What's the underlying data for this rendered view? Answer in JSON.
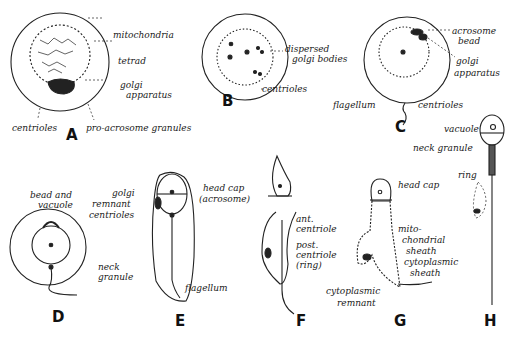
{
  "panels": [
    {
      "id": "A",
      "labels": [
        "mitochondria",
        "tetrad",
        "golgi",
        "apparatus",
        "centrioles",
        "pro-acrosome granules"
      ]
    },
    {
      "id": "B",
      "labels": [
        "dispersed",
        "golgi bodies",
        "centrioles"
      ]
    },
    {
      "id": "C",
      "labels": [
        "acrosome",
        "bead",
        "golgi",
        "apparatus",
        "flagellum",
        "centrioles"
      ]
    },
    {
      "id": "D",
      "labels": [
        "bead and",
        "vacuole",
        "neck",
        "granule"
      ]
    },
    {
      "id": "E",
      "labels": [
        "golgi",
        "remnant",
        "centrioles",
        "head cap",
        "(acrosome)",
        "flagellum"
      ]
    },
    {
      "id": "F",
      "labels": [
        "ant.",
        "centriole",
        "post.",
        "centriole",
        "(ring)"
      ]
    },
    {
      "id": "G",
      "labels": [
        "head cap",
        "mito-",
        "chondrial",
        "sheath",
        "cytoplasmic",
        "sheath",
        "cytoplasmic",
        "remnant"
      ]
    },
    {
      "id": "H",
      "labels": [
        "vacuole",
        "neck granule",
        "ring"
      ]
    }
  ]
}
